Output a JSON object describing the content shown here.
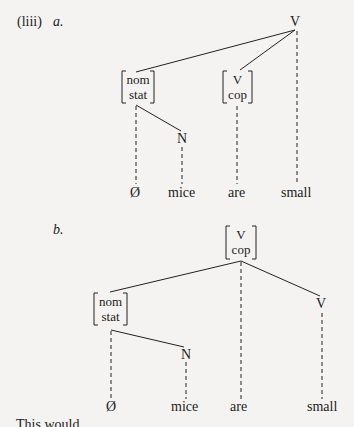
{
  "example": {
    "number": "(liii)",
    "a": {
      "letter": "a.",
      "root": "V",
      "nom_node": [
        "nom",
        "stat"
      ],
      "cop_node": [
        "V",
        "cop"
      ],
      "n_node": "N",
      "leaves": [
        "Ø",
        "mice",
        "are",
        "small"
      ]
    },
    "b": {
      "letter": "b.",
      "root_node": [
        "V",
        "cop"
      ],
      "nom_node": [
        "nom",
        "stat"
      ],
      "n_node": "N",
      "v_node": "V",
      "leaves": [
        "Ø",
        "mice",
        "are",
        "small"
      ]
    }
  },
  "following_text_fragment": "This would"
}
